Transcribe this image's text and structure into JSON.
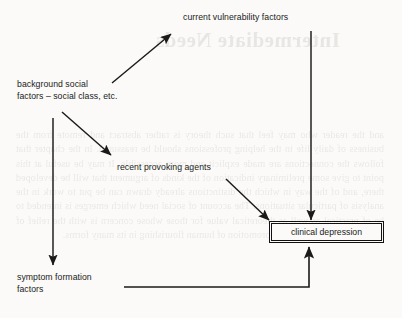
{
  "page": {
    "background_color": "#fbfaf8",
    "ink_color": "#1a1a1a"
  },
  "ghost": {
    "heading": "Intermediate Needs",
    "body": "and the reader who may feel that such theory is rather abstract and remote from the business of daily life in the helping professions should be reassured. In the chapter that follows the connections are made explicit and more accessible. It may be useful at this point to give some preliminary indication of the kinds of argument that will be developed there, and of the way in which the distinctions already drawn can be put to work in the analysis of particular situations. The account of social need which emerges is intended to be of practical as well as theoretical value for those whose concern is with the relief of avoidable suffering and the promotion of human flourishing in its many forms."
  },
  "diagram": {
    "type": "flowchart",
    "nodes": [
      {
        "id": "current-vulnerability",
        "label": "current vulnerability factors",
        "boxed": false
      },
      {
        "id": "background-social",
        "label_line1": "background social",
        "label_line2": "factors – social class, etc.",
        "boxed": false
      },
      {
        "id": "recent-provoking",
        "label": "recent provoking agents",
        "boxed": false
      },
      {
        "id": "clinical-depression",
        "label": "clinical depression",
        "boxed": true
      },
      {
        "id": "symptom-formation",
        "label_line1": "symptom formation",
        "label_line2": "factors",
        "boxed": false
      }
    ],
    "edges": [
      {
        "from": "background-social",
        "to": "current-vulnerability",
        "style": "diagonal-up-right"
      },
      {
        "from": "background-social",
        "to": "recent-provoking",
        "style": "diagonal-down-right"
      },
      {
        "from": "background-social",
        "to": "symptom-formation",
        "style": "vertical-down"
      },
      {
        "from": "current-vulnerability",
        "to": "clinical-depression",
        "style": "vertical-down"
      },
      {
        "from": "recent-provoking",
        "to": "clinical-depression",
        "style": "diagonal-down-right"
      },
      {
        "from": "symptom-formation",
        "to": "clinical-depression",
        "style": "elbow-right-then-up"
      }
    ]
  }
}
